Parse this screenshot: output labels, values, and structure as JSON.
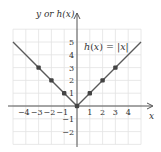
{
  "chart_data": {
    "type": "line",
    "title": "",
    "function_label": "h(x) = |x|",
    "xlabel": "x",
    "ylabel": "y or h(x)",
    "xlim": [
      -5,
      5
    ],
    "ylim": [
      -3,
      6
    ],
    "grid": true,
    "x_ticks": [
      -4,
      -3,
      -2,
      -1,
      1,
      2,
      3,
      4
    ],
    "x_tick_labels": [
      "−4",
      "−3",
      "−2",
      "−1",
      "1",
      "2",
      "3",
      "4"
    ],
    "y_ticks": [
      5,
      4,
      3,
      2,
      1,
      -1,
      -2
    ],
    "y_tick_labels": [
      "5",
      "4",
      "3",
      "2",
      "1",
      "−1",
      "−2"
    ],
    "series": [
      {
        "name": "h(x) = |x|",
        "line": {
          "x": [
            -5,
            0,
            5
          ],
          "y": [
            5,
            0,
            5
          ]
        },
        "points": {
          "x": [
            -3,
            -2,
            -1,
            0,
            1,
            2,
            3
          ],
          "y": [
            3,
            2,
            1,
            0,
            1,
            2,
            3
          ]
        }
      }
    ],
    "colors": {
      "line": "#5a5a5a",
      "points": "#444444",
      "grid": "#e2e2e2",
      "axis": "#555555"
    }
  },
  "labels": {
    "y_axis": "y or h(x)",
    "x_axis": "x",
    "equation_lhs": "h(x) = |",
    "equation_var": "x",
    "equation_rhs": "|"
  }
}
